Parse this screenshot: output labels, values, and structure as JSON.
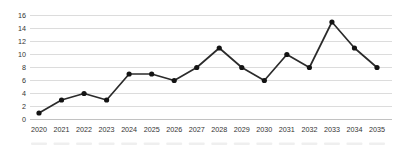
{
  "chart_data": {
    "type": "line",
    "title": "",
    "xlabel": "",
    "ylabel": "",
    "categories": [
      "2020",
      "2021",
      "2022",
      "2023",
      "2024",
      "2025",
      "2026",
      "2027",
      "2028",
      "2029",
      "2030",
      "2031",
      "2032",
      "2033",
      "2034",
      "2035"
    ],
    "values": [
      1,
      3,
      4,
      3,
      7,
      7,
      6,
      8,
      11,
      8,
      6,
      10,
      8,
      15,
      11,
      8
    ],
    "ylim": [
      0,
      16
    ],
    "ytick_step": 2,
    "ytick_labels": [
      "0",
      "2",
      "4",
      "6",
      "8",
      "10",
      "12",
      "14",
      "16"
    ],
    "grid": true,
    "legend_position": "none",
    "colors": {
      "line": "#2b2b2b",
      "marker": "#141414",
      "gridline": "#dcdcdc",
      "axis_line": "#c2c2c2",
      "tick_label": "#333333",
      "background": "#ffffff",
      "bottom_artifact": "#ededed"
    }
  }
}
